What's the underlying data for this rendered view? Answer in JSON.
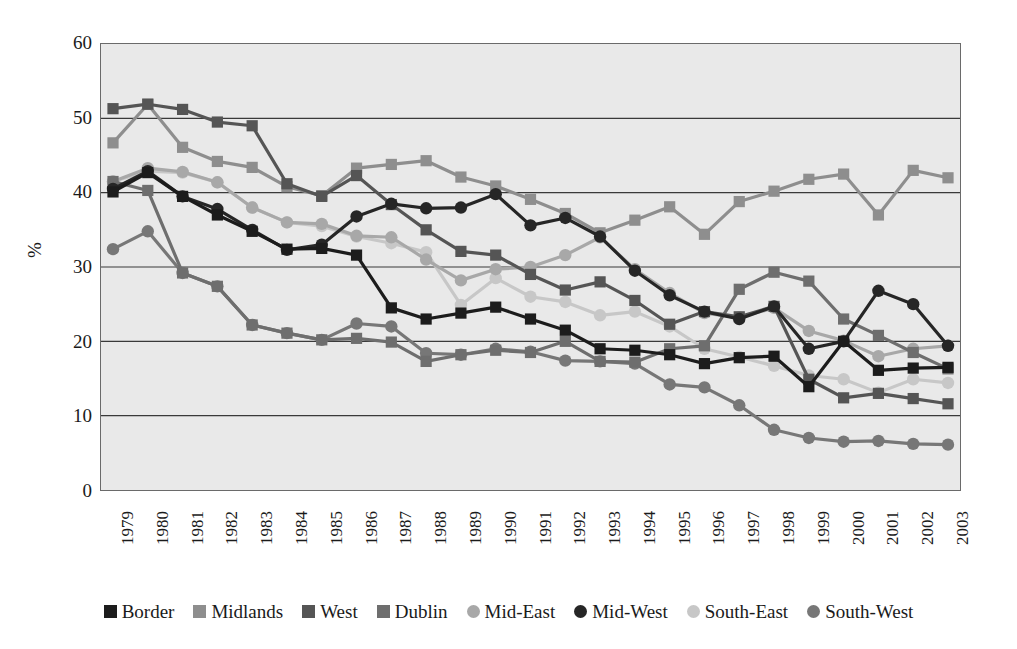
{
  "caption_remnant": "",
  "axes": {
    "ylabel": "%",
    "ytick_labels": [
      "60",
      "50",
      "40",
      "30",
      "20",
      "10",
      "0"
    ],
    "xtick_labels": [
      "1979",
      "1980",
      "1981",
      "1982",
      "1983",
      "1984",
      "1985",
      "1986",
      "1987",
      "1988",
      "1989",
      "1990",
      "1991",
      "1992",
      "1993",
      "1994",
      "1995",
      "1996",
      "1997",
      "1998",
      "1999",
      "2000",
      "2001",
      "2002",
      "2003"
    ]
  },
  "legend": {
    "position": "bottom",
    "items": [
      {
        "label": "Border",
        "marker": "square",
        "color": "#1c1c1c"
      },
      {
        "label": "Midlands",
        "marker": "square",
        "color": "#8e8e8e"
      },
      {
        "label": "West",
        "marker": "square",
        "color": "#555555"
      },
      {
        "label": "Dublin",
        "marker": "square",
        "color": "#6e6e6e"
      },
      {
        "label": "Mid-East",
        "marker": "circle",
        "color": "#a8a8a8"
      },
      {
        "label": "Mid-West",
        "marker": "circle",
        "color": "#262626"
      },
      {
        "label": "South-East",
        "marker": "circle",
        "color": "#c7c7c7"
      },
      {
        "label": "South-West",
        "marker": "circle",
        "color": "#777777"
      }
    ]
  },
  "chart_data": {
    "type": "line",
    "title": "",
    "subtitle": "",
    "xlabel": "",
    "ylabel": "%",
    "ylim": [
      0,
      60
    ],
    "ytick_step": 10,
    "grid": "horizontal",
    "legend_position": "bottom",
    "x": [
      "1979",
      "1980",
      "1981",
      "1982",
      "1983",
      "1984",
      "1985",
      "1986",
      "1987",
      "1988",
      "1989",
      "1990",
      "1991",
      "1992",
      "1993",
      "1994",
      "1995",
      "1996",
      "1997",
      "1998",
      "1999",
      "2000",
      "2001",
      "2002",
      "2003"
    ],
    "series": [
      {
        "name": "Border",
        "marker": "square",
        "color": "#1c1c1c",
        "values": [
          40.1,
          42.7,
          39.5,
          37.0,
          34.8,
          32.4,
          32.5,
          31.6,
          24.5,
          23.0,
          23.8,
          24.6,
          23.0,
          21.5,
          19.0,
          18.8,
          18.2,
          17.0,
          17.8,
          18.0,
          13.9,
          20.0,
          16.1,
          16.4,
          16.5
        ]
      },
      {
        "name": "Midlands",
        "marker": "square",
        "color": "#8e8e8e",
        "values": [
          46.7,
          51.9,
          46.1,
          44.2,
          43.4,
          40.8,
          39.6,
          43.3,
          43.8,
          44.3,
          42.1,
          40.9,
          39.1,
          37.2,
          34.6,
          36.3,
          38.1,
          34.4,
          38.8,
          40.2,
          41.8,
          42.5,
          37.0,
          43.0,
          42.0
        ]
      },
      {
        "name": "West",
        "marker": "square",
        "color": "#555555",
        "values": [
          51.3,
          51.9,
          51.2,
          49.5,
          49.0,
          41.2,
          39.5,
          42.3,
          38.4,
          35.0,
          32.1,
          31.6,
          29.0,
          26.9,
          28.0,
          25.5,
          22.3,
          24.0,
          23.3,
          24.7,
          14.9,
          12.4,
          13.0,
          12.3,
          11.6
        ]
      },
      {
        "name": "Dublin",
        "marker": "square",
        "color": "#6e6e6e",
        "values": [
          41.5,
          40.3,
          29.2,
          27.4,
          22.2,
          21.1,
          20.2,
          20.4,
          19.9,
          17.3,
          18.2,
          18.8,
          18.5,
          20.0,
          17.3,
          17.2,
          19.0,
          19.4,
          27.0,
          29.3,
          28.1,
          23.0,
          20.8,
          18.5,
          16.3
        ]
      },
      {
        "name": "Mid-East",
        "marker": "circle",
        "color": "#a8a8a8",
        "values": [
          41.5,
          43.3,
          42.8,
          41.4,
          38.0,
          36.0,
          35.8,
          34.2,
          34.0,
          31.0,
          28.2,
          29.7,
          30.0,
          31.6,
          34.0,
          29.7,
          26.5,
          23.8,
          23.2,
          24.5,
          21.4,
          20.1,
          18.0,
          19.0,
          19.4
        ]
      },
      {
        "name": "Mid-West",
        "marker": "circle",
        "color": "#262626",
        "values": [
          40.5,
          42.9,
          39.5,
          37.8,
          35.0,
          32.3,
          33.0,
          36.8,
          38.5,
          37.9,
          38.0,
          39.8,
          35.6,
          36.6,
          34.1,
          29.5,
          26.2,
          24.0,
          23.0,
          24.7,
          19.0,
          20.0,
          26.8,
          25.0,
          19.4
        ]
      },
      {
        "name": "South-East",
        "marker": "circle",
        "color": "#c7c7c7",
        "values": [
          41.5,
          42.9,
          42.7,
          41.4,
          38.0,
          36.0,
          35.5,
          34.1,
          33.2,
          32.0,
          24.9,
          28.5,
          26.0,
          25.3,
          23.5,
          24.0,
          22.0,
          19.0,
          17.9,
          16.7,
          15.4,
          14.9,
          13.1,
          14.9,
          14.4
        ]
      },
      {
        "name": "South-West",
        "marker": "circle",
        "color": "#777777",
        "values": [
          32.4,
          34.8,
          29.2,
          27.4,
          22.2,
          21.1,
          20.2,
          22.4,
          22.0,
          18.4,
          18.2,
          19.0,
          18.6,
          17.4,
          17.3,
          17.0,
          14.2,
          13.8,
          11.4,
          8.1,
          7.0,
          6.5,
          6.6,
          6.2,
          6.1
        ]
      }
    ]
  }
}
